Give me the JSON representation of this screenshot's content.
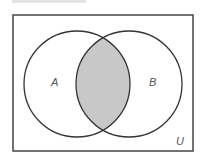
{
  "diagram": {
    "type": "venn",
    "universe": {
      "label": "U",
      "x": 13,
      "y": 15,
      "width": 180,
      "height": 136
    },
    "sets": [
      {
        "label": "A",
        "cx": 77,
        "cy": 84,
        "r": 53
      },
      {
        "label": "B",
        "cx": 129,
        "cy": 84,
        "r": 53
      }
    ],
    "shaded_region": "A ∩ B",
    "colors": {
      "stroke": "#333333",
      "shade": "#c8c8c8",
      "label": "#555555"
    }
  }
}
